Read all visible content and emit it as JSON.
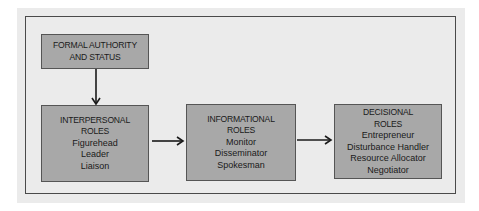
{
  "diagram": {
    "nodes": [
      {
        "id": "formal",
        "title_lines": [
          "FORMAL AUTHORITY",
          "AND STATUS"
        ],
        "items": []
      },
      {
        "id": "interpersonal",
        "title_lines": [
          "INTERPERSONAL",
          "ROLES"
        ],
        "items": [
          "Figurehead",
          "Leader",
          "Liaison"
        ]
      },
      {
        "id": "informational",
        "title_lines": [
          "INFORMATIONAL",
          "ROLES"
        ],
        "items": [
          "Monitor",
          "Disseminator",
          "Spokesman"
        ]
      },
      {
        "id": "decisional",
        "title_lines": [
          "DECISIONAL",
          "ROLES"
        ],
        "items": [
          "Entrepreneur",
          "Disturbance Handler",
          "Resource Allocator",
          "Negotiator"
        ]
      }
    ],
    "edges": [
      {
        "from": "formal",
        "to": "interpersonal"
      },
      {
        "from": "interpersonal",
        "to": "informational"
      },
      {
        "from": "informational",
        "to": "decisional"
      }
    ],
    "colors": {
      "box_fill": "#a8a8a8",
      "panel": "#ebebeb",
      "line": "#1a1a1a"
    }
  }
}
